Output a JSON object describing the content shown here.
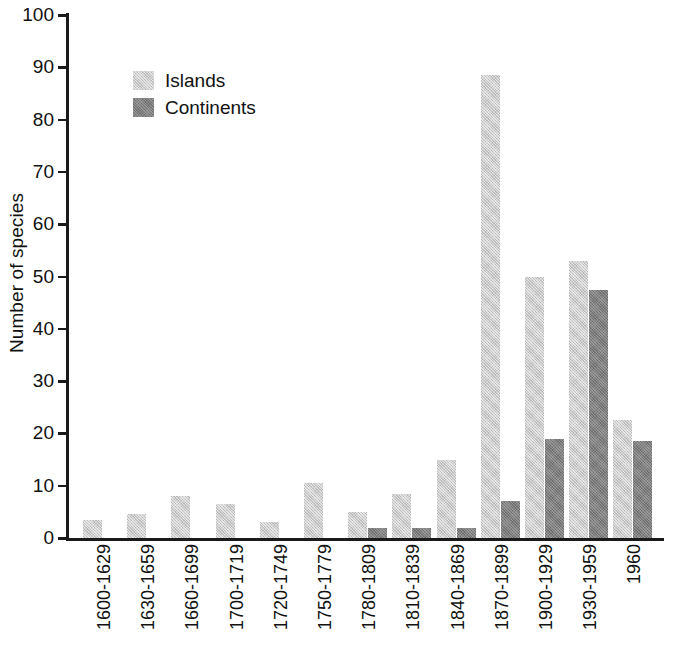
{
  "chart_data": {
    "type": "bar",
    "title": "",
    "xlabel": "",
    "ylabel": "Number of species",
    "ylim": [
      0,
      100
    ],
    "yticks": [
      0,
      10,
      20,
      30,
      40,
      50,
      60,
      70,
      80,
      90,
      100
    ],
    "grid": false,
    "legend_position": "top-left",
    "categories": [
      "1600-1629",
      "1630-1659",
      "1660-1699",
      "1700-1719",
      "1720-1749",
      "1750-1779",
      "1780-1809",
      "1810-1839",
      "1840-1869",
      "1870-1899",
      "1900-1929",
      "1930-1959",
      "1960"
    ],
    "series": [
      {
        "name": "Islands",
        "color": "#cbcbcb",
        "values": [
          3.5,
          4.5,
          8,
          6.5,
          3,
          10.5,
          5,
          8.5,
          15,
          88.5,
          50,
          53,
          22.5
        ]
      },
      {
        "name": "Continents",
        "color": "#7f7f7f",
        "values": [
          0,
          0,
          0,
          0,
          0,
          0,
          2,
          2,
          2,
          7,
          19,
          47.5,
          18.5
        ]
      }
    ]
  },
  "axis": {
    "y_title": "Number of species"
  },
  "legend": {
    "entries": [
      {
        "label": "Islands",
        "swatch": "islands"
      },
      {
        "label": "Continents",
        "swatch": "continents"
      }
    ]
  }
}
